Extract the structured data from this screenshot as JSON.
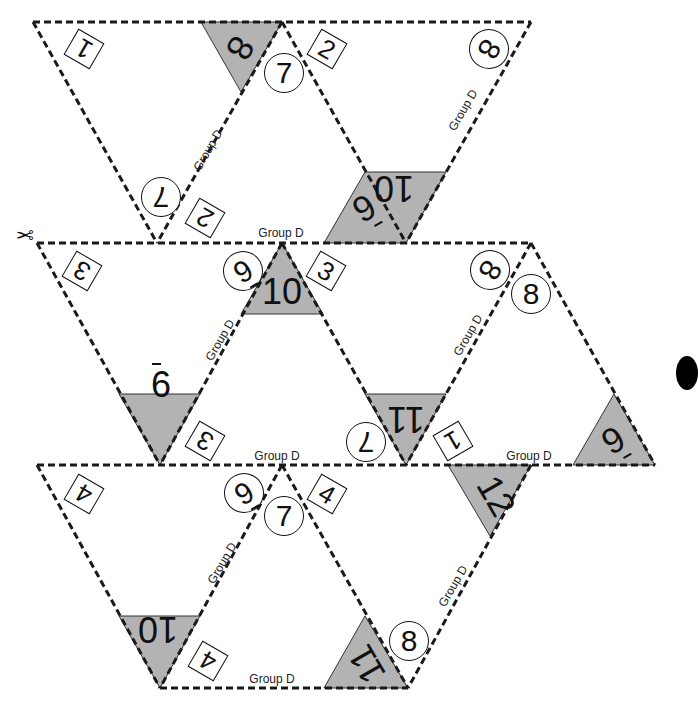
{
  "group_label": "Group D",
  "colors": {
    "shade": "#b3b3b3",
    "line": "#1a1a1a",
    "background": "#ffffff"
  },
  "icons": {
    "scissors": "scissors-icon",
    "bullet": "black-dot"
  },
  "square_labels": [
    {
      "id": "sq1a",
      "text": "1",
      "x": 83,
      "y": 48,
      "rot": -150
    },
    {
      "id": "sq2a",
      "text": "2",
      "x": 326,
      "y": 48,
      "rot": 30
    },
    {
      "id": "sq2b",
      "text": "2",
      "x": 204,
      "y": 217,
      "rot": 210
    },
    {
      "id": "sq3a",
      "text": "3",
      "x": 81,
      "y": 270,
      "rot": -150
    },
    {
      "id": "sq3b",
      "text": "3",
      "x": 325,
      "y": 270,
      "rot": 30
    },
    {
      "id": "sq3c",
      "text": "3",
      "x": 204,
      "y": 440,
      "rot": 210
    },
    {
      "id": "sq1b",
      "text": "1",
      "x": 452,
      "y": 440,
      "rot": 150
    },
    {
      "id": "sq4a",
      "text": "4",
      "x": 83,
      "y": 493,
      "rot": -150
    },
    {
      "id": "sq4b",
      "text": "4",
      "x": 326,
      "y": 493,
      "rot": 30
    },
    {
      "id": "sq4c",
      "text": "4",
      "x": 207,
      "y": 660,
      "rot": 210
    }
  ],
  "circle_labels": [
    {
      "id": "c7a",
      "text": "7",
      "x": 283,
      "y": 72,
      "rot": 0,
      "bar": false
    },
    {
      "id": "c8a",
      "text": "8",
      "x": 488,
      "y": 48,
      "rot": 120,
      "bar": false
    },
    {
      "id": "c7b",
      "text": "7",
      "x": 160,
      "y": 196,
      "rot": 180,
      "bar": false
    },
    {
      "id": "c6a",
      "text": "6",
      "x": 242,
      "y": 270,
      "rot": 150,
      "bar": true
    },
    {
      "id": "c8b",
      "text": "8",
      "x": 489,
      "y": 269,
      "rot": 120,
      "bar": false
    },
    {
      "id": "c8c",
      "text": "8",
      "x": 530,
      "y": 293,
      "rot": 0,
      "bar": false
    },
    {
      "id": "c7c",
      "text": "7",
      "x": 365,
      "y": 441,
      "rot": 180,
      "bar": false
    },
    {
      "id": "c6b",
      "text": "6",
      "x": 243,
      "y": 492,
      "rot": 150,
      "bar": true
    },
    {
      "id": "c7d",
      "text": "7",
      "x": 283,
      "y": 515,
      "rot": 0,
      "bar": false
    },
    {
      "id": "c8d",
      "text": "8",
      "x": 408,
      "y": 640,
      "rot": 0,
      "bar": false
    }
  ],
  "shaded_labels": [
    {
      "id": "s8",
      "text": "8",
      "x": 240,
      "y": 48,
      "rot": 120,
      "bar": false
    },
    {
      "id": "s6a",
      "text": "6",
      "x": 364,
      "y": 208,
      "rot": 150,
      "bar": true
    },
    {
      "id": "s10a",
      "text": "10",
      "x": 394,
      "y": 188,
      "rot": 180,
      "bar": false
    },
    {
      "id": "s10b",
      "text": "10",
      "x": 282,
      "y": 292,
      "rot": 0,
      "bar": false
    },
    {
      "id": "s6b",
      "text": "6",
      "x": 161,
      "y": 385,
      "rot": 0,
      "bar": true
    },
    {
      "id": "s11a",
      "text": "11",
      "x": 406,
      "y": 419,
      "rot": 180,
      "bar": false
    },
    {
      "id": "s6c",
      "text": "6",
      "x": 613,
      "y": 440,
      "rot": 150,
      "bar": true
    },
    {
      "id": "s12",
      "text": "12",
      "x": 496,
      "y": 496,
      "rot": 60,
      "bar": false
    },
    {
      "id": "s10c",
      "text": "10",
      "x": 158,
      "y": 629,
      "rot": 180,
      "bar": false
    },
    {
      "id": "s11b",
      "text": "11",
      "x": 367,
      "y": 664,
      "rot": 240,
      "bar": false
    }
  ],
  "group_texts": [
    {
      "id": "g1",
      "text": "Group D",
      "x": 208,
      "y": 150,
      "rot": -60
    },
    {
      "id": "g2",
      "text": "Group D",
      "x": 463,
      "y": 110,
      "rot": -60
    },
    {
      "id": "g3",
      "text": "Group D",
      "x": 281,
      "y": 233,
      "rot": 0
    },
    {
      "id": "g4",
      "text": "Group D",
      "x": 220,
      "y": 340,
      "rot": -60
    },
    {
      "id": "g5",
      "text": "Group D",
      "x": 468,
      "y": 335,
      "rot": -60
    },
    {
      "id": "g6",
      "text": "Group D",
      "x": 277,
      "y": 456,
      "rot": 0
    },
    {
      "id": "g7",
      "text": "Group D",
      "x": 529,
      "y": 456,
      "rot": 0
    },
    {
      "id": "g8",
      "text": "Group D",
      "x": 222,
      "y": 563,
      "rot": -60
    },
    {
      "id": "g9",
      "text": "Group D",
      "x": 453,
      "y": 586,
      "rot": -60
    },
    {
      "id": "g10",
      "text": "Group D",
      "x": 272,
      "y": 679,
      "rot": 0
    }
  ]
}
